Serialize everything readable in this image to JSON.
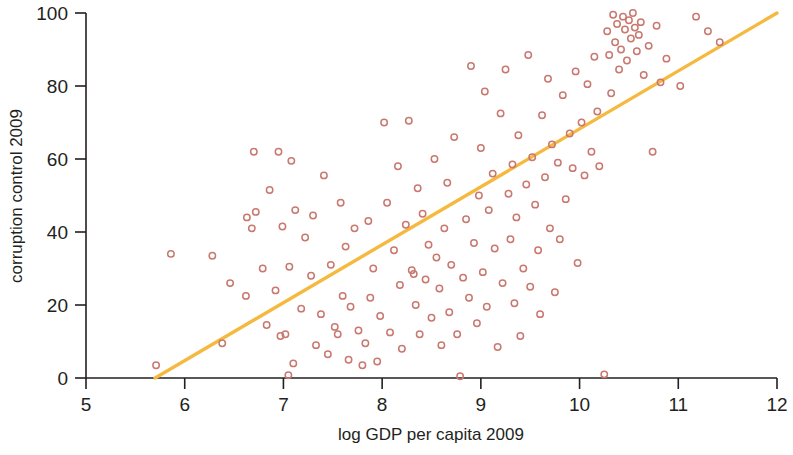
{
  "chart_data": {
    "type": "scatter",
    "title": "",
    "xlabel": "log GDP per capita 2009",
    "ylabel": "corruption control 2009",
    "xlim": [
      5,
      12
    ],
    "ylim": [
      0,
      100
    ],
    "xticks": [
      5,
      6,
      7,
      8,
      9,
      10,
      11,
      12
    ],
    "yticks": [
      0,
      20,
      40,
      60,
      80,
      100
    ],
    "grid": false,
    "legend": "none",
    "marker_style": "open-circle",
    "marker_color": "#c9786f",
    "trendline": {
      "name": "linear fit",
      "color": "#f6b93f",
      "x": [
        5.7,
        12.0
      ],
      "y": [
        0,
        100
      ]
    },
    "series": [
      {
        "name": "countries",
        "color": "#c9786f",
        "points": [
          [
            5.71,
            3.5
          ],
          [
            5.86,
            34.0
          ],
          [
            6.28,
            33.5
          ],
          [
            6.38,
            9.5
          ],
          [
            6.46,
            26.0
          ],
          [
            6.62,
            22.5
          ],
          [
            6.63,
            44.0
          ],
          [
            6.68,
            41.0
          ],
          [
            6.7,
            62.0
          ],
          [
            6.72,
            45.5
          ],
          [
            6.79,
            30.0
          ],
          [
            6.83,
            14.5
          ],
          [
            6.86,
            51.5
          ],
          [
            6.92,
            24.0
          ],
          [
            6.95,
            62.0
          ],
          [
            6.97,
            11.5
          ],
          [
            6.99,
            41.5
          ],
          [
            7.02,
            12.0
          ],
          [
            7.05,
            0.8
          ],
          [
            7.06,
            30.5
          ],
          [
            7.08,
            59.5
          ],
          [
            7.1,
            4.0
          ],
          [
            7.12,
            46.0
          ],
          [
            7.18,
            19.0
          ],
          [
            7.22,
            38.5
          ],
          [
            7.28,
            28.0
          ],
          [
            7.3,
            44.5
          ],
          [
            7.33,
            9.0
          ],
          [
            7.38,
            17.5
          ],
          [
            7.41,
            55.5
          ],
          [
            7.45,
            6.5
          ],
          [
            7.48,
            31.0
          ],
          [
            7.52,
            14.0
          ],
          [
            7.55,
            12.0
          ],
          [
            7.58,
            48.0
          ],
          [
            7.6,
            22.5
          ],
          [
            7.63,
            36.0
          ],
          [
            7.66,
            5.0
          ],
          [
            7.68,
            19.5
          ],
          [
            7.72,
            41.0
          ],
          [
            7.76,
            13.0
          ],
          [
            7.8,
            3.5
          ],
          [
            7.83,
            9.5
          ],
          [
            7.86,
            43.0
          ],
          [
            7.88,
            22.0
          ],
          [
            7.91,
            30.0
          ],
          [
            7.95,
            4.5
          ],
          [
            7.98,
            17.0
          ],
          [
            8.02,
            70.0
          ],
          [
            8.05,
            48.0
          ],
          [
            8.08,
            12.5
          ],
          [
            8.12,
            35.0
          ],
          [
            8.16,
            58.0
          ],
          [
            8.18,
            25.5
          ],
          [
            8.2,
            8.0
          ],
          [
            8.24,
            42.0
          ],
          [
            8.27,
            70.5
          ],
          [
            8.3,
            29.5
          ],
          [
            8.32,
            28.5
          ],
          [
            8.34,
            20.0
          ],
          [
            8.36,
            52.0
          ],
          [
            8.38,
            12.0
          ],
          [
            8.41,
            45.0
          ],
          [
            8.44,
            27.0
          ],
          [
            8.47,
            36.5
          ],
          [
            8.5,
            16.5
          ],
          [
            8.53,
            60.0
          ],
          [
            8.55,
            33.0
          ],
          [
            8.58,
            24.5
          ],
          [
            8.6,
            9.0
          ],
          [
            8.63,
            41.0
          ],
          [
            8.66,
            53.5
          ],
          [
            8.68,
            18.0
          ],
          [
            8.7,
            31.0
          ],
          [
            8.73,
            66.0
          ],
          [
            8.76,
            12.0
          ],
          [
            8.79,
            0.5
          ],
          [
            8.82,
            27.5
          ],
          [
            8.85,
            43.5
          ],
          [
            8.88,
            22.0
          ],
          [
            8.9,
            85.5
          ],
          [
            8.93,
            37.0
          ],
          [
            8.96,
            15.0
          ],
          [
            8.98,
            50.0
          ],
          [
            9.0,
            63.0
          ],
          [
            9.02,
            29.0
          ],
          [
            9.04,
            78.5
          ],
          [
            9.06,
            19.5
          ],
          [
            9.08,
            46.0
          ],
          [
            9.12,
            56.0
          ],
          [
            9.14,
            35.5
          ],
          [
            9.17,
            8.5
          ],
          [
            9.2,
            72.5
          ],
          [
            9.22,
            26.0
          ],
          [
            9.25,
            84.5
          ],
          [
            9.28,
            50.5
          ],
          [
            9.3,
            38.0
          ],
          [
            9.32,
            58.5
          ],
          [
            9.34,
            20.5
          ],
          [
            9.36,
            44.0
          ],
          [
            9.38,
            66.5
          ],
          [
            9.4,
            11.5
          ],
          [
            9.43,
            30.0
          ],
          [
            9.46,
            53.0
          ],
          [
            9.48,
            88.5
          ],
          [
            9.5,
            25.0
          ],
          [
            9.52,
            60.5
          ],
          [
            9.55,
            47.5
          ],
          [
            9.58,
            35.0
          ],
          [
            9.6,
            17.5
          ],
          [
            9.62,
            72.0
          ],
          [
            9.65,
            55.0
          ],
          [
            9.68,
            82.0
          ],
          [
            9.7,
            41.0
          ],
          [
            9.72,
            64.0
          ],
          [
            9.75,
            23.5
          ],
          [
            9.78,
            59.0
          ],
          [
            9.8,
            38.0
          ],
          [
            9.83,
            77.5
          ],
          [
            9.86,
            49.0
          ],
          [
            9.9,
            67.0
          ],
          [
            9.93,
            57.5
          ],
          [
            9.96,
            84.0
          ],
          [
            9.98,
            31.5
          ],
          [
            10.02,
            70.0
          ],
          [
            10.05,
            55.5
          ],
          [
            10.08,
            80.5
          ],
          [
            10.12,
            62.0
          ],
          [
            10.15,
            88.0
          ],
          [
            10.18,
            73.0
          ],
          [
            10.2,
            58.0
          ],
          [
            10.25,
            1.0
          ],
          [
            10.28,
            95.0
          ],
          [
            10.3,
            88.5
          ],
          [
            10.32,
            78.0
          ],
          [
            10.34,
            99.5
          ],
          [
            10.36,
            92.0
          ],
          [
            10.38,
            97.0
          ],
          [
            10.4,
            84.5
          ],
          [
            10.42,
            90.0
          ],
          [
            10.44,
            99.0
          ],
          [
            10.46,
            95.5
          ],
          [
            10.48,
            87.0
          ],
          [
            10.5,
            98.0
          ],
          [
            10.52,
            93.0
          ],
          [
            10.54,
            100.0
          ],
          [
            10.56,
            96.0
          ],
          [
            10.58,
            89.5
          ],
          [
            10.6,
            94.0
          ],
          [
            10.62,
            97.5
          ],
          [
            10.65,
            83.0
          ],
          [
            10.7,
            91.0
          ],
          [
            10.74,
            62.0
          ],
          [
            10.78,
            96.5
          ],
          [
            10.82,
            81.0
          ],
          [
            10.88,
            87.5
          ],
          [
            11.02,
            80.0
          ],
          [
            11.18,
            99.0
          ],
          [
            11.3,
            95.0
          ],
          [
            11.42,
            92.0
          ]
        ]
      }
    ]
  },
  "axes": {
    "x_tick_labels": [
      "5",
      "6",
      "7",
      "8",
      "9",
      "10",
      "11",
      "12"
    ],
    "y_tick_labels": [
      "0",
      "20",
      "40",
      "60",
      "80",
      "100"
    ],
    "x_axis_title": "log GDP per capita 2009",
    "y_axis_title": "corruption control 2009"
  }
}
